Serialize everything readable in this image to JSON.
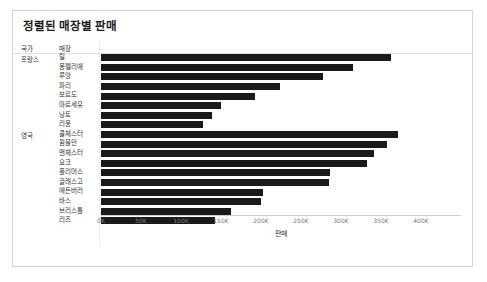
{
  "chart_data": {
    "type": "bar",
    "orientation": "horizontal",
    "title": "정렬된 매장별 판매",
    "xlabel": "판매",
    "ylabel": "",
    "xlim": [
      0,
      450000
    ],
    "grid": false,
    "legend": null,
    "column_headers": {
      "country": "국가",
      "store": "매장"
    },
    "groups": [
      {
        "country": "프랑스",
        "rows": [
          {
            "store": "릴",
            "value": 363000
          },
          {
            "store": "몽펠리에",
            "value": 315000
          },
          {
            "store": "루앙",
            "value": 278000
          },
          {
            "store": "파리",
            "value": 224000
          },
          {
            "store": "보르도",
            "value": 193000
          },
          {
            "store": "마르세유",
            "value": 150000
          },
          {
            "store": "낭트",
            "value": 139000
          },
          {
            "store": "리옹",
            "value": 128000
          }
        ]
      },
      {
        "country": "영국",
        "rows": [
          {
            "store": "콜체스터",
            "value": 371000
          },
          {
            "store": "윔블던",
            "value": 357000
          },
          {
            "store": "맨체스터",
            "value": 341000
          },
          {
            "store": "요크",
            "value": 332000
          },
          {
            "store": "플리머스",
            "value": 286000
          },
          {
            "store": "글래스고",
            "value": 285000
          },
          {
            "store": "에든버러",
            "value": 203000
          },
          {
            "store": "바스",
            "value": 200000
          },
          {
            "store": "브리스틀",
            "value": 163000
          },
          {
            "store": "리즈",
            "value": 142000
          }
        ]
      }
    ],
    "xticks": [
      {
        "value": 0,
        "label": "0K"
      },
      {
        "value": 50000,
        "label": "50K"
      },
      {
        "value": 100000,
        "label": "100K"
      },
      {
        "value": 150000,
        "label": "150K"
      },
      {
        "value": 200000,
        "label": "200K"
      },
      {
        "value": 250000,
        "label": "250K"
      },
      {
        "value": 300000,
        "label": "300K"
      },
      {
        "value": 350000,
        "label": "350K"
      },
      {
        "value": 400000,
        "label": "400K"
      }
    ],
    "colors": {
      "bar": "#1a1a1a",
      "text": "#333333",
      "tick": "#7a7a7a",
      "border": "#d4d4d4",
      "background": "#ffffff"
    }
  }
}
